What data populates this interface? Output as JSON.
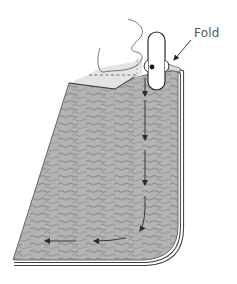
{
  "diagram": {
    "type": "sewing-illustration",
    "labels": {
      "fold": "Fold"
    },
    "colors": {
      "fabric": "#b4b4b4",
      "fabric_fold": "#e4e4e4",
      "wave": "#7a7a7a",
      "outline": "#3a3a3a",
      "arrow": "#2a2a2a",
      "label": "#555555"
    },
    "arrows": [
      {
        "name": "stitch-direction-down-1",
        "from": [
          145,
          78
        ],
        "to": [
          145,
          96
        ]
      },
      {
        "name": "stitch-direction-down-2",
        "from": [
          145,
          105
        ],
        "to": [
          145,
          140
        ]
      },
      {
        "name": "stitch-direction-down-3",
        "from": [
          145,
          150
        ],
        "to": [
          145,
          185
        ]
      },
      {
        "name": "stitch-direction-curve",
        "from": [
          145,
          195
        ],
        "to": [
          140,
          230
        ]
      },
      {
        "name": "stitch-direction-left-1",
        "from": [
          126,
          238
        ],
        "to": [
          94,
          241
        ]
      },
      {
        "name": "stitch-direction-left-2",
        "from": [
          76,
          241
        ],
        "to": [
          45,
          241
        ]
      }
    ]
  }
}
